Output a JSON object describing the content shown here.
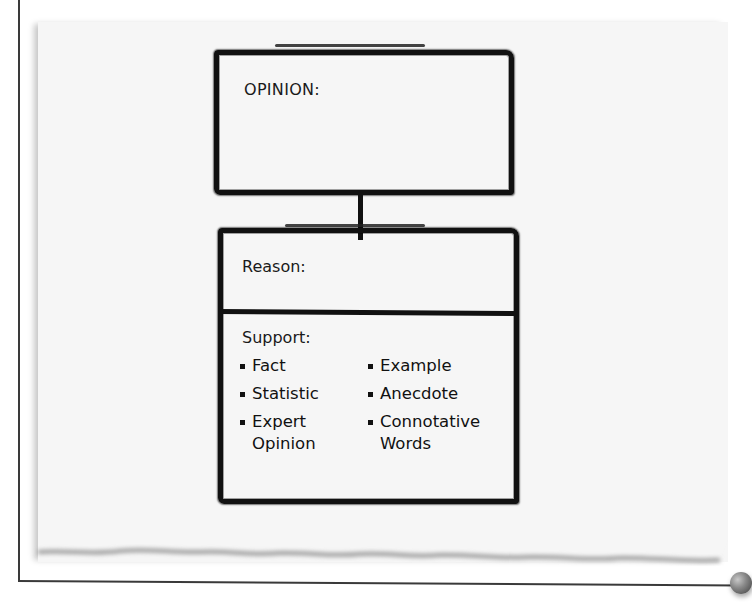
{
  "diagram": {
    "opinion_box": {
      "label": "OPINION:"
    },
    "reason_box": {
      "reason_label": "Reason:",
      "support_label": "Support:",
      "support_items_left": [
        "Fact",
        "Statistic",
        "Expert Opinion"
      ],
      "support_items_right": [
        "Example",
        "Anecdote",
        "Connotative Words"
      ]
    }
  },
  "colors": {
    "ink": "#111111",
    "paper": "#f6f6f6",
    "background": "#ffffff",
    "pin": "#7a7a7a"
  }
}
